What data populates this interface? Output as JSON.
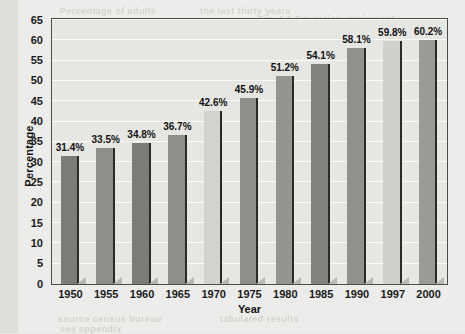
{
  "chart_data": {
    "type": "bar",
    "title": "",
    "xlabel": "Year",
    "ylabel": "Percentage",
    "categories": [
      "1950",
      "1955",
      "1960",
      "1965",
      "1970",
      "1975",
      "1980",
      "1985",
      "1990",
      "1997",
      "2000"
    ],
    "values": [
      31.4,
      33.5,
      34.8,
      36.7,
      42.6,
      45.9,
      51.2,
      54.1,
      58.1,
      59.8,
      60.2
    ],
    "data_labels": [
      "31.4%",
      "33.5%",
      "34.8%",
      "36.7%",
      "42.6%",
      "45.9%",
      "51.2%",
      "54.1%",
      "58.1%",
      "59.8%",
      "60.2%"
    ],
    "bar_colors": [
      "#7b7b78",
      "#8e8e8a",
      "#7b7b78",
      "#8e8e8a",
      "#d2d2ce",
      "#8e8e8a",
      "#949490",
      "#82827e",
      "#91918d",
      "#cfcfcb",
      "#9a9a96"
    ],
    "ylim": [
      0,
      65
    ],
    "yticks": [
      0,
      5,
      10,
      15,
      20,
      25,
      30,
      35,
      40,
      45,
      50,
      55,
      60,
      65
    ],
    "ytick_labels": [
      "0",
      "5",
      "10",
      "15",
      "20",
      "25",
      "30",
      "35",
      "40",
      "45",
      "50",
      "55",
      "60",
      "65"
    ],
    "grid": true,
    "grid_axis": "y",
    "legend": "none",
    "frame_color": "#4b4b4b",
    "plot_background": "#e6e6e2",
    "page_background": "#ececea"
  },
  "ghost_text": [
    {
      "text": "Percentage of adults",
      "x": 60,
      "y": 6
    },
    {
      "text": "the last thirty years",
      "x": 200,
      "y": 6
    },
    {
      "text": "Fig. 4.1 Education attainment",
      "x": 258,
      "y": 14
    },
    {
      "text": "survey data shows",
      "x": 66,
      "y": 26
    },
    {
      "text": "completion rates rising",
      "x": 158,
      "y": 26
    },
    {
      "text": "steady growth",
      "x": 62,
      "y": 40
    },
    {
      "text": "across all groups",
      "x": 150,
      "y": 40
    },
    {
      "text": "national totals",
      "x": 60,
      "y": 54
    },
    {
      "text": "reported annually",
      "x": 290,
      "y": 54
    },
    {
      "text": "source census bureau",
      "x": 58,
      "y": 314
    },
    {
      "text": "tabulated results",
      "x": 220,
      "y": 314
    },
    {
      "text": "see appendix",
      "x": 60,
      "y": 324
    }
  ]
}
